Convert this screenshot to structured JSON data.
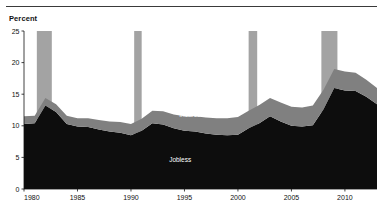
{
  "figure": {
    "ylabel": "Percent",
    "has_top_rule": true
  },
  "chart_data": {
    "type": "area",
    "stacked": true,
    "title": "",
    "subtitle": "",
    "xlabel": "",
    "ylabel": "Percent",
    "xlim": [
      1980,
      2013
    ],
    "ylim": [
      0,
      25
    ],
    "ytick_values": [
      0,
      5,
      10,
      15,
      20,
      25
    ],
    "ytick_labels": [
      "0",
      "5",
      "10",
      "15",
      "20",
      "25"
    ],
    "xtick_values": [
      1980,
      1985,
      1990,
      1995,
      2000,
      2005,
      2010
    ],
    "xtick_labels": [
      "1980",
      "1985",
      "1990",
      "1995",
      "2000",
      "2005",
      "2010"
    ],
    "grid": false,
    "legend_position": "inline-annotation",
    "x": [
      1980,
      1981,
      1982,
      1983,
      1984,
      1985,
      1986,
      1987,
      1988,
      1989,
      1990,
      1991,
      1992,
      1993,
      1994,
      1995,
      1996,
      1997,
      1998,
      1999,
      2000,
      2001,
      2002,
      2003,
      2004,
      2005,
      2006,
      2007,
      2008,
      2009,
      2010,
      2011,
      2012,
      2013
    ],
    "series": [
      {
        "name": "Jobless",
        "color": "#0d0d0d",
        "label_color": "#ffffff",
        "values": [
          10.3,
          10.4,
          13.2,
          12.2,
          10.3,
          9.9,
          9.8,
          9.4,
          9.1,
          8.9,
          8.5,
          9.2,
          10.4,
          10.2,
          9.6,
          9.2,
          9.1,
          8.8,
          8.6,
          8.5,
          8.6,
          9.6,
          10.4,
          11.5,
          10.7,
          10.0,
          9.9,
          10.1,
          12.6,
          16.0,
          15.6,
          15.5,
          14.6,
          13.4
        ]
      },
      {
        "name": "Incarcerated",
        "color": "#808080",
        "label_color": "#ffffff",
        "values": [
          1.2,
          1.2,
          1.2,
          1.2,
          1.3,
          1.3,
          1.4,
          1.5,
          1.6,
          1.7,
          1.8,
          1.9,
          2.0,
          2.1,
          2.2,
          2.3,
          2.4,
          2.5,
          2.6,
          2.7,
          2.8,
          2.8,
          2.9,
          2.9,
          3.0,
          3.0,
          3.0,
          3.1,
          3.1,
          3.0,
          3.0,
          2.9,
          2.7,
          2.6
        ]
      }
    ],
    "annotations": [
      {
        "text": "Incarcerated",
        "x": 1996.2,
        "y": 11.4
      },
      {
        "text": "Jobless",
        "x": 1994.6,
        "y": 4.3
      }
    ],
    "recession_bands": [
      {
        "start": 1981.2,
        "end": 1982.6
      },
      {
        "start": 1990.3,
        "end": 1991.0
      },
      {
        "start": 2001.0,
        "end": 2001.8
      },
      {
        "start": 2007.8,
        "end": 2009.3
      }
    ],
    "recession_band_color": "#a3a3a3"
  }
}
